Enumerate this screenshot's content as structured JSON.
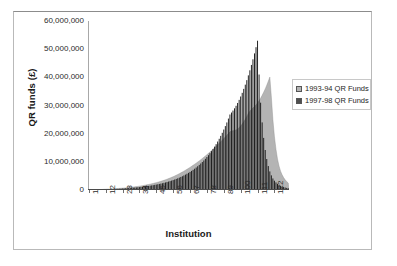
{
  "chart_data": {
    "type": "area",
    "title": "",
    "xlabel": "Institution",
    "ylabel": "QR funds (£)",
    "ylim": [
      0,
      60000000
    ],
    "ytick_labels": [
      "60,000,000",
      "50,000,000",
      "40,000,000",
      "30,000,000",
      "20,000,000",
      "10,000,000",
      "0"
    ],
    "ytick_values": [
      60000000,
      50000000,
      40000000,
      30000000,
      20000000,
      10000000,
      0
    ],
    "xtick_labels": [
      "1",
      "12",
      "23",
      "34",
      "45",
      "56",
      "67",
      "78",
      "89",
      "100",
      "111",
      "122"
    ],
    "xtick_values": [
      1,
      12,
      23,
      34,
      45,
      56,
      67,
      78,
      89,
      100,
      111,
      122
    ],
    "xlim": [
      1,
      131
    ],
    "grid": false,
    "legend_position": "right",
    "series": [
      {
        "name": "1993-94 QR Funds",
        "color": "#b4b4b4",
        "render": "area",
        "values": [
          20000,
          40000,
          60000,
          80000,
          100000,
          120000,
          140000,
          160000,
          180000,
          200000,
          230000,
          260000,
          290000,
          320000,
          350000,
          380000,
          410000,
          450000,
          490000,
          530000,
          570000,
          610000,
          650000,
          700000,
          750000,
          800000,
          860000,
          920000,
          980000,
          1050000,
          1120000,
          1200000,
          1280000,
          1360000,
          1450000,
          1540000,
          1640000,
          1740000,
          1850000,
          1960000,
          2080000,
          2200000,
          2330000,
          2470000,
          2610000,
          2760000,
          2920000,
          3080000,
          3260000,
          3440000,
          3630000,
          3830000,
          4040000,
          4260000,
          4490000,
          4730000,
          4980000,
          5240000,
          5510000,
          5790000,
          6080000,
          6380000,
          6690000,
          7010000,
          7340000,
          7680000,
          8030000,
          8390000,
          8760000,
          9140000,
          9530000,
          9930000,
          10340000,
          10760000,
          11190000,
          11630000,
          12080000,
          12540000,
          13010000,
          13490000,
          13980000,
          14480000,
          14990000,
          15510000,
          16040000,
          16580000,
          17130000,
          17690000,
          18260000,
          18840000,
          19430000,
          20030000,
          20640000,
          20900000,
          21050000,
          21150000,
          21300000,
          21600000,
          22100000,
          22700000,
          23400000,
          24200000,
          25100000,
          26100000,
          27200000,
          28000000,
          28600000,
          29100000,
          29600000,
          30200000,
          30900000,
          31700000,
          32600000,
          33600000,
          34700000,
          35900000,
          37200000,
          38600000,
          40100000,
          33000000,
          25000000,
          19000000,
          14500000,
          11000000,
          8500000,
          6700000,
          5400000,
          4400000,
          3600000,
          3000000,
          2500000
        ]
      },
      {
        "name": "1997-98 QR Funds",
        "color": "#1a1a1a",
        "render": "bars",
        "values": [
          15000,
          30000,
          45000,
          62000,
          78000,
          95000,
          112000,
          130000,
          148000,
          167000,
          187000,
          208000,
          230000,
          253000,
          277000,
          302000,
          328000,
          356000,
          385000,
          415000,
          447000,
          480000,
          515000,
          552000,
          590000,
          630000,
          672000,
          716000,
          762000,
          810000,
          861000,
          914000,
          970000,
          1029000,
          1091000,
          1156000,
          1225000,
          1297000,
          1373000,
          1453000,
          1537000,
          1626000,
          1720000,
          1819000,
          1923000,
          2033000,
          2149000,
          2271000,
          2400000,
          2536000,
          2680000,
          2832000,
          2992000,
          3161000,
          3339000,
          3527000,
          3725000,
          3934000,
          4155000,
          4388000,
          4634000,
          4894000,
          5168000,
          5457000,
          5762000,
          6084000,
          6424000,
          6783000,
          7162000,
          7562000,
          7985000,
          8432000,
          8904000,
          9403000,
          9931000,
          10489000,
          11079000,
          11703000,
          12363000,
          13061000,
          13799000,
          14580000,
          15406000,
          16280000,
          17204000,
          18182000,
          19216000,
          20310000,
          21467000,
          22691000,
          23986000,
          25355000,
          26803000,
          27500000,
          28200000,
          29000000,
          29900000,
          30900000,
          32000000,
          33200000,
          34500000,
          35900000,
          37400000,
          39000000,
          40700000,
          42500000,
          44400000,
          46400000,
          48500000,
          50700000,
          53000000,
          41000000,
          31000000,
          24000000,
          18500000,
          14200000,
          11000000,
          8500000,
          6600000,
          5200000,
          4100000,
          3300000,
          2700000,
          2200000,
          1800000,
          1500000,
          1250000,
          1050000,
          880000,
          740000,
          620000
        ]
      }
    ]
  },
  "legend": {
    "items": [
      {
        "label": "1993-94 QR Funds",
        "swatch_color": "#b4b4b4"
      },
      {
        "label": "1997-98 QR Funds",
        "swatch_color": "#4f4f4f"
      }
    ]
  },
  "axes": {
    "y_title": "QR funds (£)",
    "x_title": "Institution"
  }
}
